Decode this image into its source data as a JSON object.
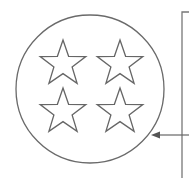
{
  "diagram": {
    "circle": {
      "cx": 90,
      "cy": 89,
      "r": 74,
      "stroke": "#666666"
    },
    "stars": [
      {
        "cx": 63,
        "cy": 64,
        "label": "star-top-left"
      },
      {
        "cx": 120,
        "cy": 64,
        "label": "star-top-right"
      },
      {
        "cx": 63,
        "cy": 112,
        "label": "star-bottom-left"
      },
      {
        "cx": 120,
        "cy": 112,
        "label": "star-bottom-right"
      }
    ],
    "star_count": 4,
    "bracket": {
      "x": 182,
      "y_top": 12,
      "y_bottom": 178,
      "stroke": "#777777"
    },
    "arrow": {
      "from_x": 189,
      "to_x": 151,
      "y": 135,
      "stroke": "#666666"
    },
    "colors": {
      "line": "#666666",
      "background": "#ffffff"
    }
  }
}
